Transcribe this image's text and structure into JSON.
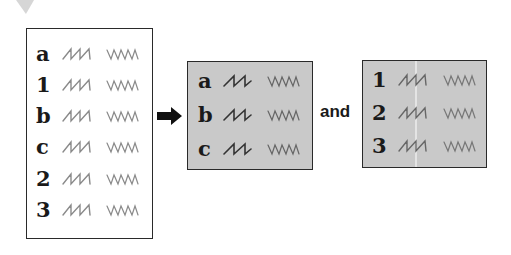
{
  "diagram": {
    "source_box": {
      "style": "white",
      "rows": [
        {
          "label": "a"
        },
        {
          "label": "1"
        },
        {
          "label": "b"
        },
        {
          "label": "c"
        },
        {
          "label": "2"
        },
        {
          "label": "3"
        }
      ]
    },
    "connector": {
      "icon": "right-arrow-icon"
    },
    "result_box_letters": {
      "style": "gray",
      "rows": [
        {
          "label": "a"
        },
        {
          "label": "b"
        },
        {
          "label": "c"
        }
      ]
    },
    "conjunction": "and",
    "result_box_numbers": {
      "style": "gray",
      "rows": [
        {
          "label": "1"
        },
        {
          "label": "2"
        },
        {
          "label": "3"
        }
      ]
    },
    "colors": {
      "box_border": "#2a2a2a",
      "gray_fill": "#c9c9c9",
      "text": "#1a1a1a",
      "squiggle": "#8a8a8a"
    }
  }
}
